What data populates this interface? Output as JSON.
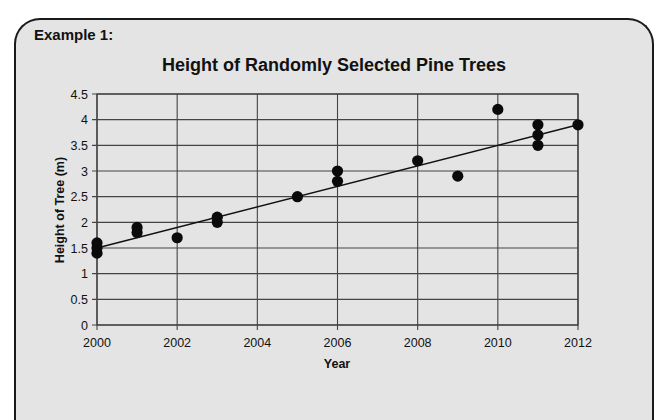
{
  "card": {
    "label": "Example 1:"
  },
  "chart_data": {
    "type": "scatter",
    "title": "Height of Randomly Selected Pine Trees",
    "xlabel": "Year",
    "ylabel": "Height of Tree (m)",
    "xlim": [
      2000,
      2012
    ],
    "ylim": [
      0,
      4.5
    ],
    "x_ticks": [
      2000,
      2002,
      2004,
      2006,
      2008,
      2010,
      2012
    ],
    "y_ticks": [
      0,
      0.5,
      1,
      1.5,
      2,
      2.5,
      3,
      3.5,
      4,
      4.5
    ],
    "grid": true,
    "legend": "none",
    "points": [
      {
        "x": 2000,
        "y": 1.4
      },
      {
        "x": 2000,
        "y": 1.5
      },
      {
        "x": 2000,
        "y": 1.6
      },
      {
        "x": 2001,
        "y": 1.8
      },
      {
        "x": 2001,
        "y": 1.9
      },
      {
        "x": 2002,
        "y": 1.7
      },
      {
        "x": 2003,
        "y": 2.0
      },
      {
        "x": 2003,
        "y": 2.1
      },
      {
        "x": 2005,
        "y": 2.5
      },
      {
        "x": 2006,
        "y": 2.8
      },
      {
        "x": 2006,
        "y": 3.0
      },
      {
        "x": 2008,
        "y": 3.2
      },
      {
        "x": 2009,
        "y": 2.9
      },
      {
        "x": 2010,
        "y": 4.2
      },
      {
        "x": 2011,
        "y": 3.5
      },
      {
        "x": 2011,
        "y": 3.7
      },
      {
        "x": 2011,
        "y": 3.9
      },
      {
        "x": 2012,
        "y": 3.9
      }
    ],
    "trendline": {
      "type": "linear",
      "start": {
        "x": 2000,
        "y": 1.5
      },
      "end": {
        "x": 2012,
        "y": 3.9
      }
    }
  }
}
